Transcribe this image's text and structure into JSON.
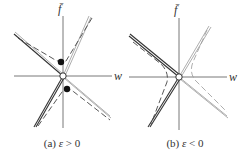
{
  "figure": {
    "panels": [
      {
        "id": "a",
        "caption_prefix": "(a) ",
        "caption_var": "ε",
        "caption_rel": " > 0",
        "axis_labels": {
          "x": "w",
          "y": "f̄"
        },
        "features": [
          "asymptote lines crossing at origin (open circle)",
          "dashed hyperbola branches in upper-left/lower-right sectors",
          "two filled dots at hyperbola vertices"
        ]
      },
      {
        "id": "b",
        "caption_prefix": "(b) ",
        "caption_var": "ε",
        "caption_rel": " < 0",
        "axis_labels": {
          "x": "w",
          "y": "f̄"
        },
        "features": [
          "asymptote lines crossing at origin (open circle)",
          "dashed hyperbola branches in left/right sectors",
          "no filled dots"
        ]
      }
    ]
  },
  "colors": {
    "line_dark": "#333333",
    "line_light": "#999999",
    "background": "#ffffff"
  }
}
